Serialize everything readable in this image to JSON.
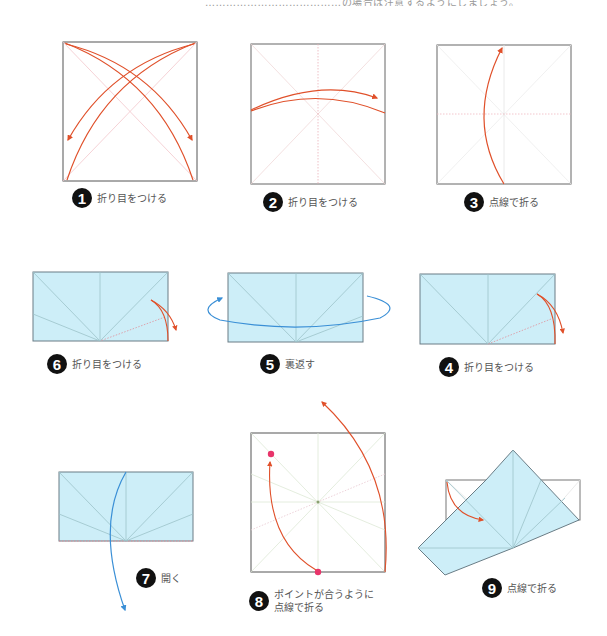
{
  "header": {
    "partial_text": "…………………………………の場合は注意するようにしましょう。"
  },
  "colors": {
    "paper_blue": "#cdeef8",
    "paper_edge": "#6a7d86",
    "crease_line": "#9cc3c9",
    "fold_arrow_red": "#e0502a",
    "turn_arrow_blue": "#3a8fd6",
    "point_pink": "#e8346a",
    "square_border": "#555555",
    "badge_bg": "#111111"
  },
  "steps": [
    {
      "number": "1",
      "caption": "折り目をつける"
    },
    {
      "number": "2",
      "caption": "折り目をつける"
    },
    {
      "number": "3",
      "caption": "点線で折る"
    },
    {
      "number": "4",
      "caption": "折り目をつける"
    },
    {
      "number": "5",
      "caption": "裏返す"
    },
    {
      "number": "6",
      "caption": "折り目をつける"
    },
    {
      "number": "7",
      "caption": "開く"
    },
    {
      "number": "8",
      "caption_line1": "ポイントが合うように",
      "caption_line2": "点線で折る"
    },
    {
      "number": "9",
      "caption": "点線で折る"
    }
  ]
}
